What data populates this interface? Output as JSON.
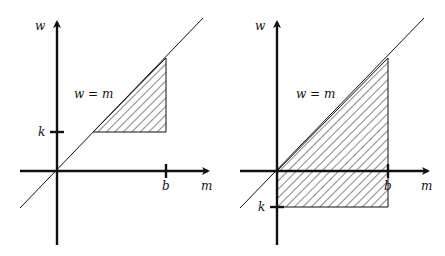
{
  "diagram": {
    "panels": [
      {
        "id": "left",
        "x_axis_label": "m",
        "y_axis_label": "w",
        "line_label": "w = m",
        "x_tick_label": "b",
        "y_tick_label": "k",
        "description": "Region k ≤ w ≤ m ≤ b with k > 0, hatched triangle"
      },
      {
        "id": "right",
        "x_axis_label": "m",
        "y_axis_label": "w",
        "line_label": "w = m",
        "x_tick_label": "b",
        "y_tick_label": "k",
        "description": "Region k ≤ w ≤ m ≤ b with k < 0, hatched trapezoid"
      }
    ]
  }
}
